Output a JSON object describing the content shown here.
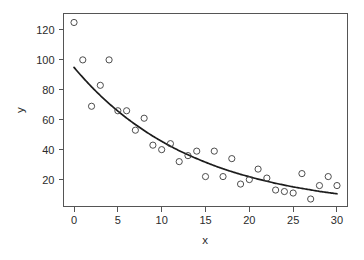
{
  "chart_data": {
    "type": "scatter",
    "title": "",
    "subtitle": "",
    "xlabel": "x",
    "ylabel": "y",
    "xlim": [
      -1.2,
      31.2
    ],
    "ylim": [
      2.0,
      131.0
    ],
    "xticks": [
      0,
      5,
      10,
      15,
      20,
      25,
      30
    ],
    "xticklabels": [
      "0",
      "5",
      "10",
      "15",
      "20",
      "25",
      "30"
    ],
    "yticks": [
      20,
      40,
      60,
      80,
      100,
      120
    ],
    "yticklabels": [
      "20",
      "40",
      "60",
      "80",
      "100",
      "120"
    ],
    "grid": false,
    "legend": null,
    "legend_position": "none",
    "frame": "box",
    "marker": "open-circle",
    "marker_size": 3.1,
    "point_color": "#3a3a3a",
    "curve_color": "#1c1c1c",
    "background_color": "#ffffff",
    "x": [
      0,
      1,
      2,
      3,
      4,
      5,
      6,
      7,
      8,
      9,
      10,
      11,
      12,
      13,
      14,
      15,
      16,
      17,
      18,
      19,
      20,
      21,
      22,
      23,
      24,
      25,
      26,
      27,
      28,
      29,
      30
    ],
    "y": [
      125,
      100,
      69,
      83,
      100,
      66,
      66,
      53,
      61,
      43,
      40,
      44,
      32,
      36,
      39,
      22,
      39,
      22,
      34,
      17,
      20,
      27,
      21,
      13,
      12,
      11,
      24,
      7,
      16,
      22,
      16
    ],
    "series": [
      {
        "name": "observations",
        "type": "scatter",
        "x": [
          0,
          1,
          2,
          3,
          4,
          5,
          6,
          7,
          8,
          9,
          10,
          11,
          12,
          13,
          14,
          15,
          16,
          17,
          18,
          19,
          20,
          21,
          22,
          23,
          24,
          25,
          26,
          27,
          28,
          29,
          30
        ],
        "values": [
          125,
          100,
          69,
          83,
          100,
          66,
          66,
          53,
          61,
          43,
          40,
          44,
          32,
          36,
          39,
          22,
          39,
          22,
          34,
          17,
          20,
          27,
          21,
          13,
          12,
          11,
          24,
          7,
          16,
          22,
          16
        ]
      },
      {
        "name": "fitted exponential curve",
        "type": "line",
        "model": "y = 95 * exp(-0.0735 * x)",
        "x": [
          0,
          1,
          2,
          3,
          4,
          5,
          6,
          7,
          8,
          9,
          10,
          11,
          12,
          13,
          14,
          15,
          16,
          17,
          18,
          19,
          20,
          21,
          22,
          23,
          24,
          25,
          26,
          27,
          28,
          29,
          30
        ],
        "values": [
          95.0,
          88.3,
          82.0,
          76.2,
          70.8,
          65.8,
          61.1,
          56.8,
          52.8,
          49.0,
          45.6,
          42.3,
          39.3,
          36.6,
          34.0,
          31.6,
          29.3,
          27.2,
          25.3,
          23.5,
          21.9,
          20.3,
          18.9,
          17.5,
          16.3,
          15.1,
          14.1,
          13.1,
          12.1,
          11.3,
          10.5
        ]
      }
    ]
  },
  "figure": {
    "xlabel": "x",
    "ylabel": "y"
  }
}
